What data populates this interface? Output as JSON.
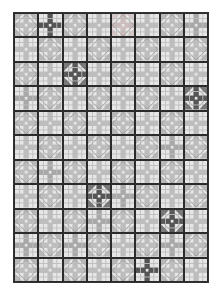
{
  "quilt": {
    "cols": 8,
    "rows": 11,
    "colors": {
      "background": "#e2e2e2",
      "light": "#e6e6e6",
      "mid": "#a8a8a8",
      "stripe": "#bdbdbd",
      "dark": "#555555",
      "outline": "#2b2b2b",
      "pink": "#cdbcbc"
    },
    "layout": [
      [
        "x",
        "darkcross",
        "x",
        "plaid",
        "xpink",
        "plaid",
        "x",
        "cross"
      ],
      [
        "plaid",
        "x",
        "plaid",
        "x",
        "plaid",
        "x",
        "plaid",
        "x"
      ],
      [
        "x",
        "plaid",
        "darkx",
        "plaid",
        "x",
        "plaid",
        "x",
        "plaid"
      ],
      [
        "cross",
        "x",
        "plaid",
        "x",
        "plaid",
        "x",
        "plaid",
        "darkx"
      ],
      [
        "x",
        "plaid",
        "x",
        "plaid",
        "x",
        "plaid",
        "x",
        "plaid"
      ],
      [
        "plaid",
        "x",
        "plaid",
        "x",
        "plaid",
        "x",
        "cross",
        "x"
      ],
      [
        "x",
        "cross",
        "x",
        "plaid",
        "x",
        "plaid",
        "x",
        "plaid"
      ],
      [
        "plaid",
        "x",
        "plaid",
        "darkx",
        "cross",
        "x",
        "plaid",
        "x"
      ],
      [
        "x",
        "plaid",
        "x",
        "cross",
        "x",
        "plaid",
        "darkx",
        "plaid"
      ],
      [
        "cross",
        "x",
        "cross",
        "x",
        "plaid",
        "x",
        "cross",
        "x"
      ],
      [
        "x",
        "plaid",
        "x",
        "plaid",
        "x",
        "darkcross",
        "x",
        "plaid"
      ]
    ]
  }
}
